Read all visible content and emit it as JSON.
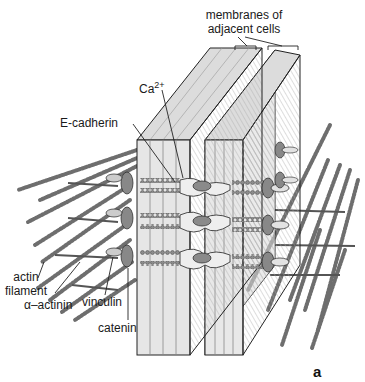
{
  "figure": {
    "panel_letter": "a"
  },
  "labels": {
    "membranes_line1": "membranes of",
    "membranes_line2": "adjacent cells",
    "calcium_base": "Ca",
    "calcium_sup": "2+",
    "e_cadherin": "E-cadherin",
    "actin_line1": "actin",
    "actin_line2": "filament",
    "alpha_actinin": "α–actinin",
    "vinculin": "vinculin",
    "catenin": "catenin"
  },
  "colors": {
    "membrane_front": "#e6e6e6",
    "membrane_side": "#cfcfcf",
    "membrane_top": "#dcdcdc",
    "protein_dark": "#8a8a8a",
    "protein_light": "#d6d6d6",
    "filament": "#7a7a7a",
    "line": "#222222"
  }
}
